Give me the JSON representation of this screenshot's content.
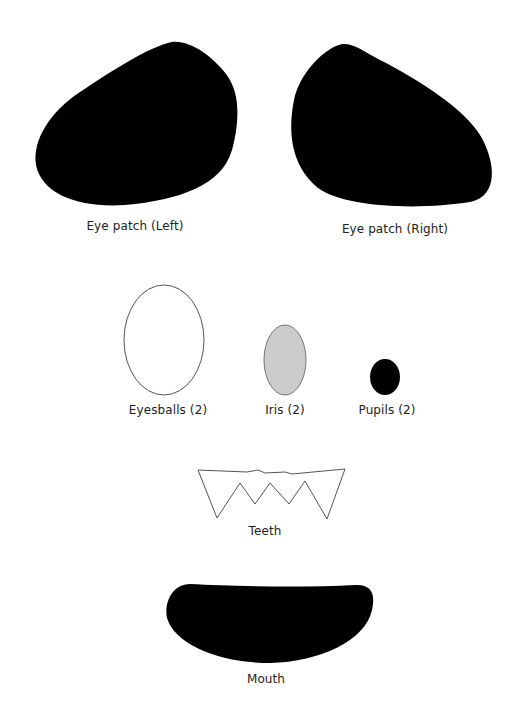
{
  "sheet": {
    "parts": [
      {
        "id": "eye-patch-left",
        "label": "Eye patch (Left)",
        "fill": "#000000"
      },
      {
        "id": "eye-patch-right",
        "label": "Eye patch (Right)",
        "fill": "#000000"
      },
      {
        "id": "eyeballs",
        "label": "Eyesballs (2)",
        "fill": "#ffffff",
        "stroke": "#555555"
      },
      {
        "id": "iris",
        "label": "Iris (2)",
        "fill": "#cccccc",
        "stroke": "#777777"
      },
      {
        "id": "pupils",
        "label": "Pupils (2)",
        "fill": "#000000"
      },
      {
        "id": "teeth",
        "label": "Teeth",
        "fill": "#ffffff",
        "stroke": "#555555"
      },
      {
        "id": "mouth",
        "label": "Mouth",
        "fill": "#000000"
      }
    ]
  }
}
